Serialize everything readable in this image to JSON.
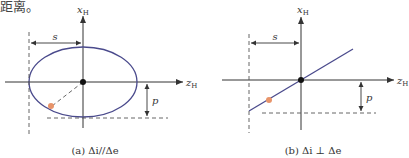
{
  "header_fragment": "距离。",
  "colors": {
    "axis": "#333333",
    "curve": "#4a4a8c",
    "dashed": "#555555",
    "point": "#e8946a",
    "center": "#111111"
  },
  "panel_a": {
    "axis_x_label": "x",
    "axis_x_sub": "H",
    "axis_z_label": "z",
    "axis_z_sub": "H",
    "dim_s": "s",
    "dim_p": "p",
    "caption": "(a) Δi//Δe",
    "shape": "ellipse"
  },
  "panel_b": {
    "axis_x_label": "x",
    "axis_x_sub": "H",
    "axis_z_label": "z",
    "axis_z_sub": "H",
    "dim_s": "s",
    "dim_p": "p",
    "caption": "(b) Δi ⊥ Δe",
    "shape": "line"
  }
}
